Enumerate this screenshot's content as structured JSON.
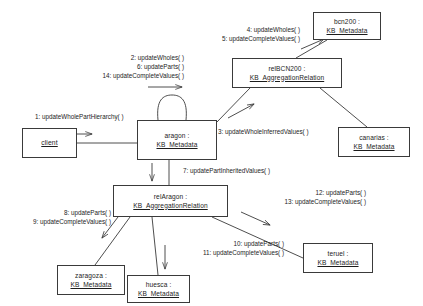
{
  "diagram": {
    "type": "uml-communication-diagram",
    "objects": [
      {
        "id": "client",
        "name": "client",
        "classifier": "",
        "single_line": true
      },
      {
        "id": "aragon",
        "name": "aragon :",
        "classifier": "KB_Metadata",
        "single_line": false
      },
      {
        "id": "relbcn200",
        "name": "relBCN200 :",
        "classifier": "KB_AggregationRelation",
        "single_line": false
      },
      {
        "id": "bcn200",
        "name": "bcn200 :",
        "classifier": "KB_Metadata",
        "single_line": false
      },
      {
        "id": "canarias",
        "name": "canarias :",
        "classifier": "KB_Metadata",
        "single_line": false
      },
      {
        "id": "relaragon",
        "name": "relAragon :",
        "classifier": "KB_AggregationRelation",
        "single_line": false
      },
      {
        "id": "zaragoza",
        "name": "zaragoza :",
        "classifier": "KB_Metadata",
        "single_line": false
      },
      {
        "id": "huesca",
        "name": "huesca :",
        "classifier": "KB_Metadata",
        "single_line": false
      },
      {
        "id": "teruel",
        "name": "teruel :",
        "classifier": "KB_Metadata",
        "single_line": false
      }
    ],
    "messages": [
      {
        "id": "m1",
        "lines": [
          "1: updateWholePartHierarchy( )"
        ],
        "from": "client",
        "to": "aragon"
      },
      {
        "id": "m2",
        "lines": [
          "2: updateWholes( )",
          "6: updateParts( )",
          "14: updateCompleteValues( )"
        ],
        "from": "aragon",
        "to": "aragon"
      },
      {
        "id": "m3",
        "lines": [
          "3: updateWholeInferredValues( )"
        ],
        "from": "aragon",
        "to": "relbcn200"
      },
      {
        "id": "m4",
        "lines": [
          "4: updateWholes( )",
          "5: updateCompleteValues( )"
        ],
        "from": "relbcn200",
        "to": "bcn200"
      },
      {
        "id": "m7",
        "lines": [
          "7: updatePartInheritedValues( )"
        ],
        "from": "aragon",
        "to": "relaragon"
      },
      {
        "id": "m8",
        "lines": [
          "8: updateParts( )",
          "9: updateCompleteValues( )"
        ],
        "from": "relaragon",
        "to": "zaragoza"
      },
      {
        "id": "m10",
        "lines": [
          "10: updateParts( )",
          "11: updateCompleteValues( )"
        ],
        "from": "relaragon",
        "to": "huesca"
      },
      {
        "id": "m12",
        "lines": [
          "12: updateParts( )",
          "13: updateCompleteValues( )"
        ],
        "from": "relaragon",
        "to": "teruel"
      }
    ],
    "colors": {
      "stroke": "#3a3a3a",
      "text": "#1c1c1c",
      "background": "#ffffff"
    }
  }
}
